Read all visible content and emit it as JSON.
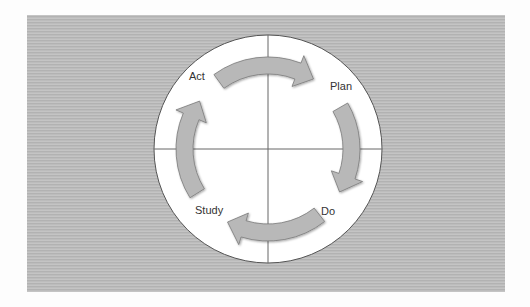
{
  "diagram": {
    "type": "cycle",
    "title": "",
    "stages": [
      {
        "label": "Plan",
        "x": 330,
        "y": 90
      },
      {
        "label": "Do",
        "x": 321,
        "y": 215
      },
      {
        "label": "Study",
        "x": 207,
        "y": 214
      },
      {
        "label": "Act",
        "x": 200,
        "y": 80
      }
    ],
    "flow": [
      "Plan",
      "Do",
      "Study",
      "Act",
      "Plan"
    ],
    "colors": {
      "background_panel": "#bcbcbc",
      "circle_fill": "#ffffff",
      "arrow_fill": "#b8b8b8",
      "arrow_stroke": "#7a7a7a",
      "line": "#555555"
    }
  }
}
